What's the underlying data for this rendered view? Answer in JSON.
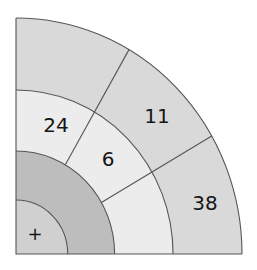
{
  "diagram": {
    "type": "quarter-dartboard",
    "colors": {
      "outer_band": "#d9d9d9",
      "middle_band": "#ececec",
      "dark_ring": "#bdbdbd",
      "center": "#d0d0d0",
      "line": "#555555",
      "text": "#161616"
    },
    "divider_angles_deg": [
      30,
      60
    ],
    "regions": [
      {
        "id": "outer-top",
        "band": "outer",
        "sector": "top",
        "label": ""
      },
      {
        "id": "outer-middle",
        "band": "outer",
        "sector": "middle",
        "label": "11"
      },
      {
        "id": "outer-bottom",
        "band": "outer",
        "sector": "bottom",
        "label": "38"
      },
      {
        "id": "middle-top",
        "band": "middle",
        "sector": "top",
        "label": "24"
      },
      {
        "id": "middle-middle",
        "band": "middle",
        "sector": "middle",
        "label": "6"
      },
      {
        "id": "middle-bottom",
        "band": "middle",
        "sector": "bottom",
        "label": ""
      },
      {
        "id": "dark-ring",
        "band": "dark",
        "sector": "full",
        "label": ""
      },
      {
        "id": "center",
        "band": "center",
        "sector": "full",
        "label": "+"
      }
    ]
  }
}
